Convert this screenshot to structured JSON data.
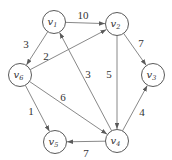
{
  "diagram": {
    "type": "directed-weighted-graph",
    "colors": {
      "node_stroke": "#5a5a5a",
      "edge": "#7a7a7a",
      "text": "#333333",
      "background": "#ffffff"
    },
    "node_radius": 11.5,
    "nodes": [
      {
        "id": "v1",
        "label": "v",
        "sub": "1",
        "x": 54,
        "y": 22
      },
      {
        "id": "v2",
        "label": "v",
        "sub": "2",
        "x": 117,
        "y": 24
      },
      {
        "id": "v3",
        "label": "v",
        "sub": "3",
        "x": 153,
        "y": 75
      },
      {
        "id": "v4",
        "label": "v",
        "sub": "4",
        "x": 117,
        "y": 141
      },
      {
        "id": "v5",
        "label": "v",
        "sub": "5",
        "x": 55,
        "y": 142
      },
      {
        "id": "v6",
        "label": "v",
        "sub": "6",
        "x": 20,
        "y": 75
      }
    ],
    "edges": [
      {
        "from": "v1",
        "to": "v2",
        "weight": "10",
        "lx": 83,
        "ly": 19
      },
      {
        "from": "v1",
        "to": "v6",
        "weight": "3",
        "lx": 26,
        "ly": 48
      },
      {
        "from": "v6",
        "to": "v2",
        "weight": "2",
        "lx": 46,
        "ly": 60
      },
      {
        "from": "v4",
        "to": "v1",
        "weight": "3",
        "lx": 88,
        "ly": 78
      },
      {
        "from": "v2",
        "to": "v4",
        "weight": "5",
        "lx": 109,
        "ly": 78
      },
      {
        "from": "v2",
        "to": "v3",
        "weight": "7",
        "lx": 141,
        "ly": 47
      },
      {
        "from": "v6",
        "to": "v4",
        "weight": "6",
        "lx": 63,
        "ly": 101
      },
      {
        "from": "v6",
        "to": "v5",
        "weight": "1",
        "lx": 31,
        "ly": 115
      },
      {
        "from": "v4",
        "to": "v5",
        "weight": "7",
        "lx": 86,
        "ly": 157
      },
      {
        "from": "v4",
        "to": "v3",
        "weight": "4",
        "lx": 142,
        "ly": 116
      }
    ]
  }
}
